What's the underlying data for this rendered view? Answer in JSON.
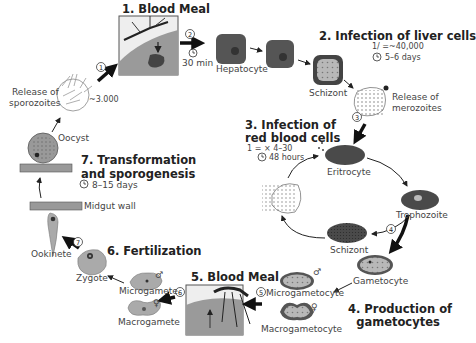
{
  "diagram": {
    "topic": "Malaria parasite (Plasmodium) life cycle",
    "stages": [
      {
        "id": 1,
        "title": "1. Blood Meal"
      },
      {
        "id": 2,
        "title": "2. Infection of liver cells",
        "formula": "1/ =~40,000",
        "duration": "5–6 days"
      },
      {
        "id": 3,
        "title_line1": "3. Infection of",
        "title_line2": "red blood cells",
        "formula": "1 =  × 4–30",
        "duration": "48 hours"
      },
      {
        "id": 4,
        "title_line1": "4. Production of",
        "title_line2": "gametocytes"
      },
      {
        "id": 5,
        "title": "5. Blood Meal"
      },
      {
        "id": 6,
        "title": "6. Fertilization"
      },
      {
        "id": 7,
        "title_line1": "7. Transformation",
        "title_line2": "and sporogenesis",
        "duration": "8–15 days"
      }
    ],
    "steps": [
      "1",
      "2",
      "3",
      "4",
      "5",
      "6",
      "7"
    ],
    "labels": {
      "release_sporozoites_1": "Release of",
      "release_sporozoites_2": "sporozoites",
      "sporozoite_count": "~3.000",
      "time_30min": "30 min",
      "hepatocyte": "Hepatocyte",
      "schizont_liver": "Schizont",
      "release_merozoites_1": "Release of",
      "release_merozoites_2": "merozoites",
      "eritrocyte": "Eritrocyte",
      "trophozoite": "Trophozoite",
      "schizont_blood": "Schizont",
      "gametocyte": "Gametocyte",
      "microgametocyte": "Microgametocyte",
      "macrogametocyte": "Macrogametocyte",
      "microgamete": "Microgamete",
      "macrogamete": "Macrogamete",
      "zygote": "Zygote",
      "ookinete": "Ookinete",
      "midgut_wall": "Midgut wall",
      "oocyst": "Oocyst"
    },
    "symbols": {
      "male": "♂",
      "female": "♀",
      "clock": "◷"
    },
    "colors": {
      "cell_dark": "#4a4a4a",
      "cell_mid": "#8a8a8a",
      "cell_light": "#b5b5b5",
      "skin": "#9a9a9a",
      "arrow": "#111111",
      "text": "#333333"
    }
  }
}
